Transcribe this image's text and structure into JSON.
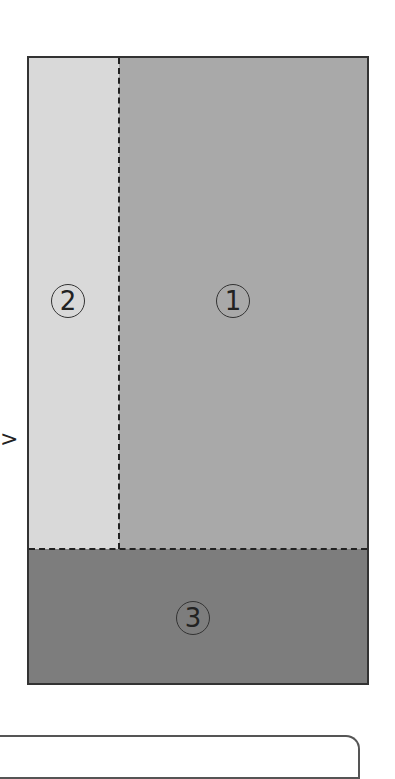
{
  "diagram": {
    "type": "area-partition",
    "regions": [
      {
        "id": "1",
        "label": "①",
        "color": "#a9a9a9",
        "position": "upper-right"
      },
      {
        "id": "2",
        "label": "②",
        "color": "#d9d9d9",
        "position": "upper-left"
      },
      {
        "id": "3",
        "label": "③",
        "color": "#7d7d7d",
        "position": "bottom"
      }
    ],
    "border_color": "#333333",
    "divider_style": "dashed",
    "side_mark": ">"
  }
}
